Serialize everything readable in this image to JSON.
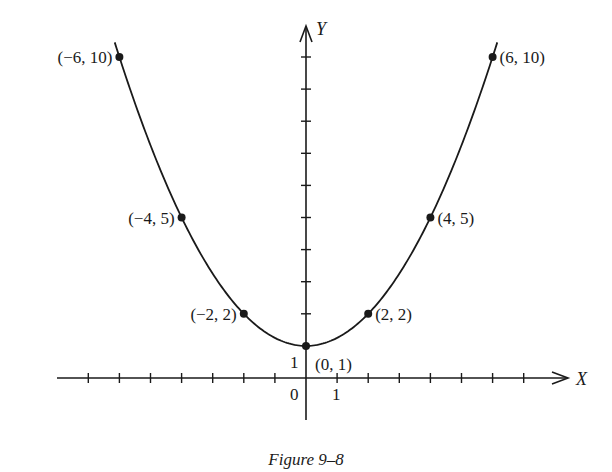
{
  "chart_data": {
    "type": "line",
    "title": "",
    "caption": "Figure 9–8",
    "xlabel": "X",
    "ylabel": "Y",
    "function": "y = x^2/4 + 1",
    "xlim": [
      -7.8,
      8.6
    ],
    "ylim": [
      -1.5,
      10.6
    ],
    "x_tick_step": 1,
    "y_tick_step": 1,
    "x_ticks": [
      -7,
      -6,
      -5,
      -4,
      -3,
      -2,
      -1,
      1,
      2,
      3,
      4,
      5,
      6,
      7
    ],
    "y_ticks": [
      2,
      3,
      4,
      5,
      6,
      7,
      8,
      9,
      10
    ],
    "tick_labels": {
      "origin": "0",
      "x_one": "1",
      "y_one": "1"
    },
    "grid": false,
    "legend": null,
    "series": [
      {
        "name": "curve",
        "x": [
          -6.15,
          -6,
          -4,
          -2,
          0,
          2,
          4,
          6,
          6.15
        ],
        "y": [
          10.46,
          10,
          5,
          2,
          1,
          2,
          5,
          10,
          10.46
        ]
      }
    ],
    "points": [
      {
        "x": -6,
        "y": 10,
        "label": "(−6, 10)",
        "anchor": "left"
      },
      {
        "x": -4,
        "y": 5,
        "label": "(−4, 5)",
        "anchor": "left"
      },
      {
        "x": -2,
        "y": 2,
        "label": "(−2, 2)",
        "anchor": "left"
      },
      {
        "x": 0,
        "y": 1,
        "label": "(0, 1)",
        "anchor": "below-right"
      },
      {
        "x": 2,
        "y": 2,
        "label": "(2, 2)",
        "anchor": "right"
      },
      {
        "x": 4,
        "y": 5,
        "label": "(4, 5)",
        "anchor": "right"
      },
      {
        "x": 6,
        "y": 10,
        "label": "(6, 10)",
        "anchor": "right"
      }
    ],
    "colors": {
      "ink": "#1a1a1a",
      "background": "#ffffff"
    }
  }
}
